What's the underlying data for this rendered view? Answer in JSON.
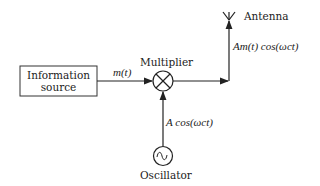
{
  "diagram": {
    "blocks": {
      "source": {
        "line1": "Information",
        "line2": "source"
      },
      "multiplier": {
        "label": "Multiplier",
        "symbol": "⊗"
      },
      "oscillator": {
        "label": "Oscillator",
        "symbol": "∿"
      },
      "antenna": {
        "label": "Antenna"
      }
    },
    "signals": {
      "message": "m(t)",
      "carrier": "A cos(ωct)",
      "modulated": "Am(t) cos(ωct)"
    },
    "colors": {
      "stroke": "#222222",
      "background": "#ffffff"
    }
  }
}
